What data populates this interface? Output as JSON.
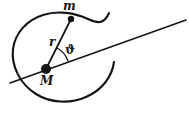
{
  "figure": {
    "kind": "spiral-orbit-diagram",
    "background_color": "#ffffff",
    "stroke_color": "#141414",
    "labels": {
      "orbiting_mass": "m",
      "central_mass": "M",
      "radius": "r",
      "angle": "ϑ"
    },
    "geometry": {
      "central_point": {
        "x": 46,
        "y": 69,
        "radius_px": 5
      },
      "orbiting_point": {
        "x": 71,
        "y": 19,
        "radius_px": 3
      },
      "axis_line": {
        "x1": 10,
        "y1": 83,
        "x2": 186,
        "y2": 20
      },
      "radius_vector": {
        "x1": 46,
        "y1": 69,
        "x2": 71,
        "y2": 19
      },
      "angle_arc": {
        "center_x": 46,
        "center_y": 69,
        "radius_px": 23
      },
      "spiral_outer_end": {
        "x": 109,
        "y": 13
      },
      "spiral_inner_end": {
        "x": 114,
        "y": 62
      }
    }
  }
}
